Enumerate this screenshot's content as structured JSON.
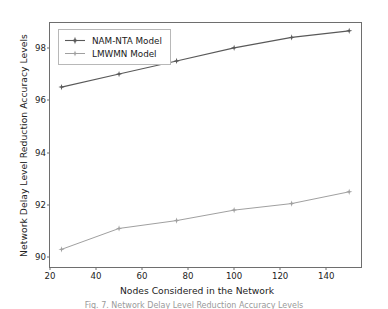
{
  "chart_data": {
    "type": "line",
    "title": "",
    "xlabel": "Nodes Considered in the Network",
    "ylabel": "Network Delay Level Reduction Accuracy Levels",
    "x": [
      25,
      50,
      75,
      100,
      125,
      150
    ],
    "xlim": [
      20,
      156
    ],
    "ylim": [
      89.55,
      98.95
    ],
    "xticks": [
      20,
      40,
      60,
      80,
      100,
      120,
      140
    ],
    "yticks": [
      90,
      92,
      94,
      96,
      98
    ],
    "xtick_labels": [
      "20",
      "40",
      "60",
      "80",
      "100",
      "120",
      "140"
    ],
    "ytick_labels": [
      "90",
      "92",
      "94",
      "96",
      "98"
    ],
    "grid": false,
    "legend_position": "upper left",
    "series": [
      {
        "name": "NAM-NTA Model",
        "values": [
          96.5,
          97.0,
          97.5,
          98.0,
          98.4,
          98.65
        ],
        "color": "#595959",
        "marker": "star",
        "linewidth": 1.1
      },
      {
        "name": "LMWMN Model",
        "values": [
          90.3,
          91.1,
          91.4,
          91.8,
          92.05,
          92.5
        ],
        "color": "#a0a0a0",
        "marker": "star",
        "linewidth": 1.0
      }
    ]
  },
  "figure": {
    "caption": "Fig. 7.  Network Delay Level Reduction Accuracy Levels",
    "axis_color": "#6e6e6e",
    "text_color": "#222222",
    "background": "#ffffff"
  },
  "legend": {
    "entries": [
      {
        "label": "NAM-NTA Model"
      },
      {
        "label": "LMWMN Model"
      }
    ]
  }
}
